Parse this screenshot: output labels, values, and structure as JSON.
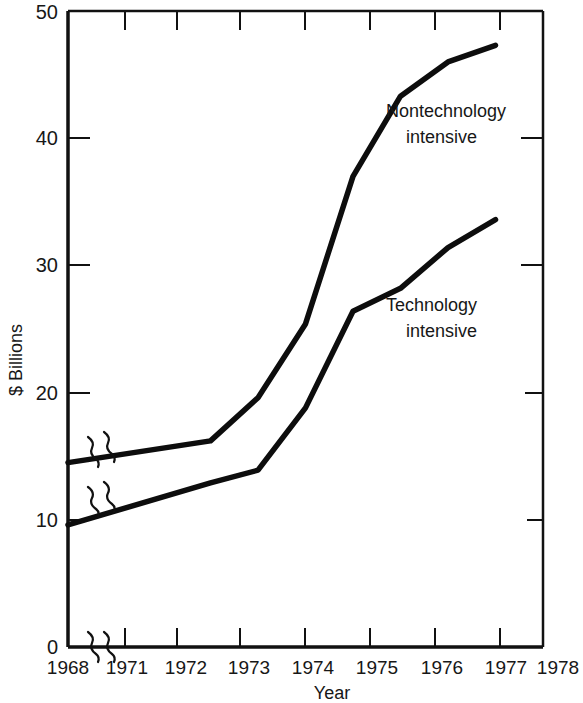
{
  "chart_data": {
    "type": "line",
    "title": "",
    "xlabel": "Year",
    "ylabel": "$ Billions",
    "x": [
      1968,
      1971,
      1972,
      1973,
      1974,
      1975,
      1976,
      1977
    ],
    "xlim": [
      1968,
      1978
    ],
    "ylim": [
      0,
      50
    ],
    "x_tick_labels": [
      "1968",
      "1971",
      "1972",
      "1973",
      "1974",
      "1975",
      "1976",
      "1977",
      "1978"
    ],
    "y_tick_labels": [
      "0",
      "10",
      "20",
      "30",
      "40",
      "50"
    ],
    "y_ticks": [
      0,
      10,
      20,
      30,
      40,
      50
    ],
    "grid": false,
    "legend_position": "inline-annotation",
    "axis_break": {
      "x_axis_break_between": [
        1968,
        1971
      ],
      "note": "squiggle break marks on x axis and on both data lines between 1968 and 1971"
    },
    "series": [
      {
        "name": "Nontechnology intensive",
        "values": [
          14.5,
          16.2,
          19.6,
          25.4,
          37.0,
          43.3,
          46.0,
          47.3
        ],
        "annotation": "Nontechnology\nintensive"
      },
      {
        "name": "Technology intensive",
        "values": [
          9.6,
          12.9,
          13.9,
          18.8,
          26.4,
          28.2,
          31.4,
          33.6
        ],
        "annotation": "Technology\nintensive"
      }
    ],
    "annotations": [
      {
        "id": "nontechnology-label",
        "line1": "Nontechnology",
        "line2": "intensive"
      },
      {
        "id": "technology-label",
        "line1": "Technology",
        "line2": "intensive"
      }
    ],
    "colors": {
      "line": "#0d0d0d",
      "axis": "#111111",
      "text": "#171717",
      "background": "#ffffff"
    }
  }
}
